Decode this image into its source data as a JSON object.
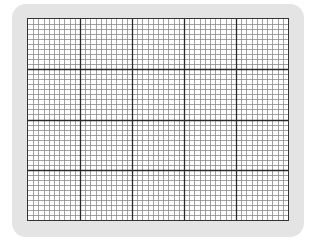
{
  "graph_paper": {
    "major_columns": 5,
    "major_rows": 4,
    "minor_divisions_per_major": 10,
    "colors": {
      "frame": "#e4e4e4",
      "paper": "#ffffff",
      "minor_line": "#8a8a8a",
      "major_line": "#2a2a2a",
      "border": "#333333"
    }
  }
}
